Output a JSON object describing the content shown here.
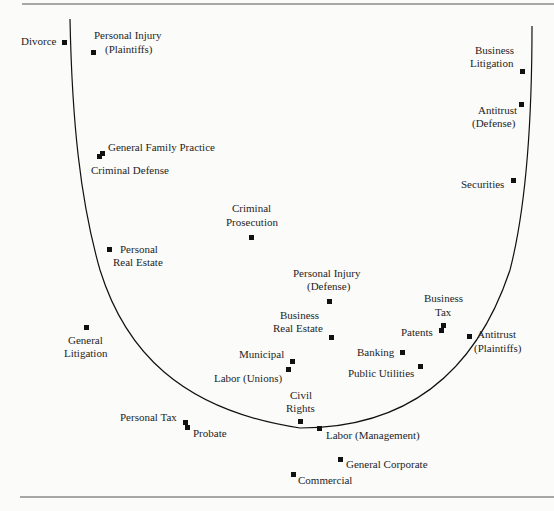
{
  "diagram": {
    "type": "U-shaped scatter of legal practice areas",
    "border_color": "#555555",
    "curve_color": "#111111",
    "points": [
      {
        "label": "Divorce",
        "x": 65,
        "y": 42
      },
      {
        "label": "Personal Injury (Plaintiffs)",
        "x": 94,
        "y": 52
      },
      {
        "label": "General Family Practice",
        "x": 103,
        "y": 153
      },
      {
        "label": "Criminal Defense",
        "x": 99,
        "y": 156
      },
      {
        "label": "Criminal Prosecution",
        "x": 251,
        "y": 237
      },
      {
        "label": "Personal Real Estate",
        "x": 109,
        "y": 249
      },
      {
        "label": "General Litigation",
        "x": 86,
        "y": 327
      },
      {
        "label": "Personal Injury (Defense)",
        "x": 329,
        "y": 301
      },
      {
        "label": "Business Real Estate",
        "x": 331,
        "y": 337
      },
      {
        "label": "Municipal",
        "x": 292,
        "y": 361
      },
      {
        "label": "Labor (Unions)",
        "x": 288,
        "y": 369
      },
      {
        "label": "Civil Rights",
        "x": 300,
        "y": 421
      },
      {
        "label": "Labor (Management)",
        "x": 319,
        "y": 428
      },
      {
        "label": "Personal Tax",
        "x": 185,
        "y": 422
      },
      {
        "label": "Probate",
        "x": 187,
        "y": 427
      },
      {
        "label": "General Corporate",
        "x": 340,
        "y": 459
      },
      {
        "label": "Commercial",
        "x": 293,
        "y": 474
      },
      {
        "label": "Business Litigation",
        "x": 522,
        "y": 71
      },
      {
        "label": "Antitrust (Defense)",
        "x": 521,
        "y": 104
      },
      {
        "label": "Securities",
        "x": 513,
        "y": 180
      },
      {
        "label": "Business Tax",
        "x": 443,
        "y": 325
      },
      {
        "label": "Patents",
        "x": 441,
        "y": 330
      },
      {
        "label": "Banking",
        "x": 402,
        "y": 352
      },
      {
        "label": "Public Utilities",
        "x": 420,
        "y": 366
      },
      {
        "label": "Antitrust (Plaintiffs)",
        "x": 469,
        "y": 336
      }
    ],
    "labels": {
      "divorce": "Divorce",
      "pi_plaintiffs_1": "Personal Injury",
      "pi_plaintiffs_2": "(Plaintiffs)",
      "general_family": "General Family Practice",
      "criminal_defense": "Criminal Defense",
      "criminal_prosecution_1": "Criminal",
      "criminal_prosecution_2": "Prosecution",
      "personal_re_1": "Personal",
      "personal_re_2": "Real Estate",
      "general_lit_1": "General",
      "general_lit_2": "Litigation",
      "pi_defense_1": "Personal Injury",
      "pi_defense_2": "(Defense)",
      "business_re_1": "Business",
      "business_re_2": "Real Estate",
      "municipal": "Municipal",
      "labor_unions": "Labor (Unions)",
      "civil_rights_1": "Civil",
      "civil_rights_2": "Rights",
      "labor_mgmt": "Labor (Management)",
      "personal_tax": "Personal Tax",
      "probate": "Probate",
      "general_corporate": "General Corporate",
      "commercial": "Commercial",
      "business_lit_1": "Business",
      "business_lit_2": "Litigation",
      "antitrust_def_1": "Antitrust",
      "antitrust_def_2": "(Defense)",
      "securities": "Securities",
      "business_tax_1": "Business",
      "business_tax_2": "Tax",
      "patents": "Patents",
      "banking": "Banking",
      "public_utilities": "Public Utilities",
      "antitrust_pl_1": "Antitrust",
      "antitrust_pl_2": "(Plaintiffs)"
    }
  }
}
